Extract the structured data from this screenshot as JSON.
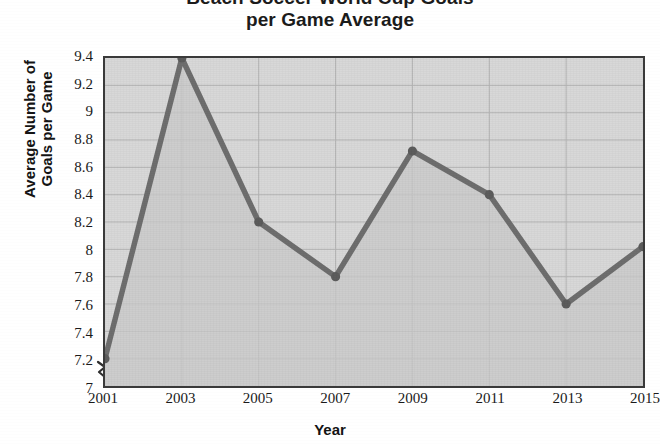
{
  "chart_data": {
    "type": "line",
    "title": "Beach Soccer World Cup Goals\nper Game Average",
    "title_line1": "Beach Soccer World Cup Goals",
    "title_line2": "per Game Average",
    "xlabel": "Year",
    "ylabel": "Average Number of\nGoals per Game",
    "ylabel_line1": "Average Number of",
    "ylabel_line2": "Goals per Game",
    "categories": [
      2001,
      2003,
      2005,
      2007,
      2009,
      2011,
      2013,
      2015
    ],
    "x_tick_labels": [
      "2001",
      "2003",
      "2005",
      "2007",
      "2009",
      "2011",
      "2013",
      "2015"
    ],
    "values": [
      7.2,
      9.4,
      8.2,
      7.8,
      8.72,
      8.4,
      7.6,
      8.02
    ],
    "y_tick_labels": [
      "9.4",
      "9.2",
      "9",
      "8.8",
      "8.6",
      "8.4",
      "8.2",
      "8",
      "7.8",
      "7.6",
      "7.4",
      "7.2",
      "7"
    ],
    "y_ticks": [
      9.4,
      9.2,
      9,
      8.8,
      8.6,
      8.4,
      8.2,
      8,
      7.8,
      7.6,
      7.4,
      7.2,
      7
    ],
    "ylim": [
      7,
      9.4
    ],
    "xlim": [
      2001,
      2015
    ],
    "grid": true,
    "legend": false,
    "axis_break": true,
    "series": [
      {
        "name": "Average Goals per Game",
        "values": [
          7.2,
          9.4,
          8.2,
          7.8,
          8.72,
          8.4,
          7.6,
          8.02
        ]
      }
    ],
    "colors": {
      "line": "#6e6e6e",
      "marker": "#5c5c5c",
      "plot_background": "#d8d8d8",
      "area_fill": "#c9c9c9",
      "grid": "#b4b4b4",
      "frame": "#3a3a3a",
      "text": "#1a1a1a"
    }
  }
}
